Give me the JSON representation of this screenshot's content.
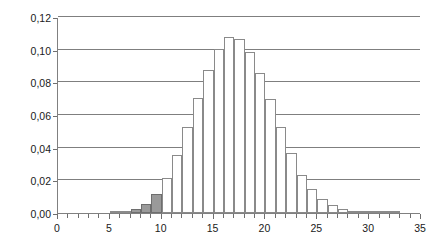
{
  "chart_data": {
    "type": "bar",
    "title": "",
    "subtitle": "",
    "xlabel": "",
    "ylabel": "",
    "xlim": [
      0,
      35
    ],
    "ylim": [
      0,
      0.12
    ],
    "grid": true,
    "legend": false,
    "decimal_separator": ",",
    "y_ticks": [
      "0,00",
      "0,02",
      "0,04",
      "0,06",
      "0,08",
      "0,10",
      "0,12"
    ],
    "y_tick_values": [
      0.0,
      0.02,
      0.04,
      0.06,
      0.08,
      0.1,
      0.12
    ],
    "x_ticks": [
      "0",
      "5",
      "10",
      "15",
      "20",
      "25",
      "30",
      "35"
    ],
    "x_tick_values": [
      0,
      5,
      10,
      15,
      20,
      25,
      30,
      35
    ],
    "x_minor_tick_step": 1,
    "bar_fill": "#ffffff",
    "bar_edge": "#8a8a8a",
    "highlight_fill": "#9a9a9a",
    "highlight_range": [
      7,
      10
    ],
    "categories": [
      0,
      1,
      2,
      3,
      4,
      5,
      6,
      7,
      8,
      9,
      10,
      11,
      12,
      13,
      14,
      15,
      16,
      17,
      18,
      19,
      20,
      21,
      22,
      23,
      24,
      25,
      26,
      27,
      28,
      29,
      30,
      31,
      32,
      33,
      34
    ],
    "values": [
      0.0,
      0.0,
      0.0,
      0.0,
      0.0,
      0.0005,
      0.0012,
      0.0026,
      0.0055,
      0.0115,
      0.0215,
      0.0355,
      0.0525,
      0.0705,
      0.0875,
      0.1005,
      0.1075,
      0.1065,
      0.0985,
      0.0855,
      0.0695,
      0.0525,
      0.0365,
      0.0235,
      0.0145,
      0.0085,
      0.0048,
      0.0026,
      0.0014,
      0.0007,
      0.0004,
      0.0002,
      0.0001,
      0.0,
      0.0
    ],
    "highlighted": [
      false,
      false,
      false,
      false,
      false,
      false,
      false,
      true,
      true,
      true,
      false,
      false,
      false,
      false,
      false,
      false,
      false,
      false,
      false,
      false,
      false,
      false,
      false,
      false,
      false,
      false,
      false,
      false,
      false,
      false,
      false,
      false,
      false,
      false,
      false
    ]
  }
}
